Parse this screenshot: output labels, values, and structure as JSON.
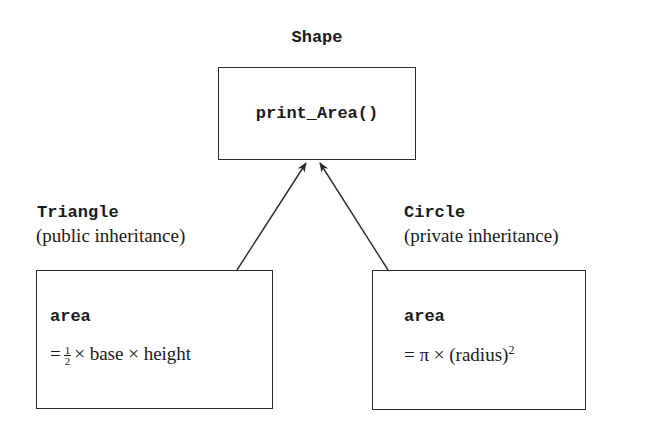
{
  "diagram": {
    "base": {
      "name": "Shape",
      "method": "print_Area()"
    },
    "derived": [
      {
        "name": "Triangle",
        "inheritance": "(public inheritance)",
        "member": "area",
        "formula_prefix": "=",
        "formula_frac_num": "1",
        "formula_frac_den": "2",
        "formula_rest": "× base × height"
      },
      {
        "name": "Circle",
        "inheritance": "(private inheritance)",
        "member": "area",
        "formula": "= π × (radius)",
        "formula_sup": "2"
      }
    ],
    "edges": [
      {
        "from": "Triangle",
        "to": "Shape",
        "type": "arrow"
      },
      {
        "from": "Circle",
        "to": "Shape",
        "type": "arrow"
      }
    ]
  }
}
